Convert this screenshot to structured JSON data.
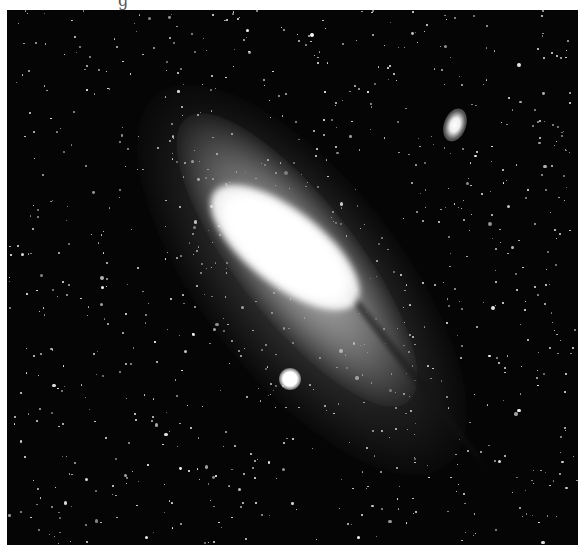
{
  "image": {
    "subject": "spiral galaxy with two satellite galaxies against dense star field",
    "style": "black-and-white astrophotograph",
    "frame": {
      "left": 7,
      "top": 10,
      "width": 571,
      "height": 535
    },
    "colors": {
      "background": "#050505",
      "page": "#ffffff",
      "core": "#ffffff"
    },
    "top_cutoff_glyph": "g"
  }
}
